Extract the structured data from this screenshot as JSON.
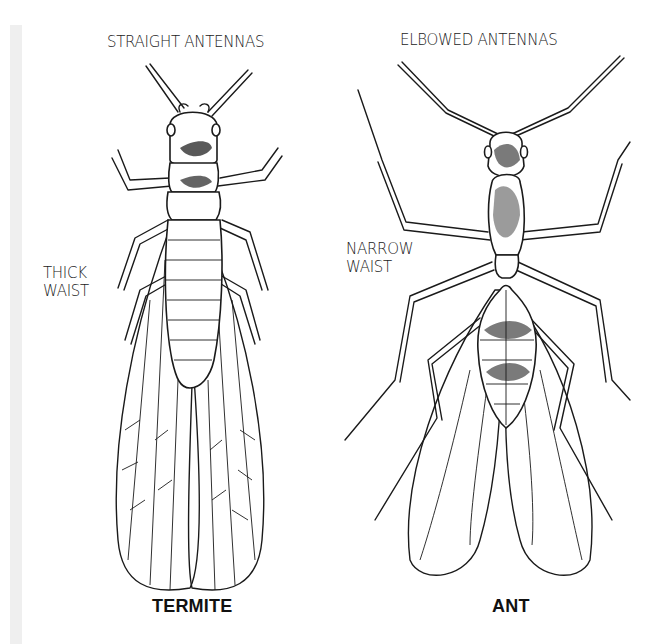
{
  "figure": {
    "headings": {
      "termite_antennas": "STRAIGHT ANTENNAS",
      "ant_antennas": "ELBOWED ANTENNAS"
    },
    "callouts": {
      "termite_waist_line1": "THICK",
      "termite_waist_line2": "WAIST",
      "ant_waist_line1": "NARROW",
      "ant_waist_line2": "WAIST"
    },
    "captions": {
      "termite": "TERMITE",
      "ant": "ANT"
    },
    "colors": {
      "ink": "#1a1a1a",
      "background": "#ffffff",
      "margin_strip": "#efefef"
    }
  }
}
